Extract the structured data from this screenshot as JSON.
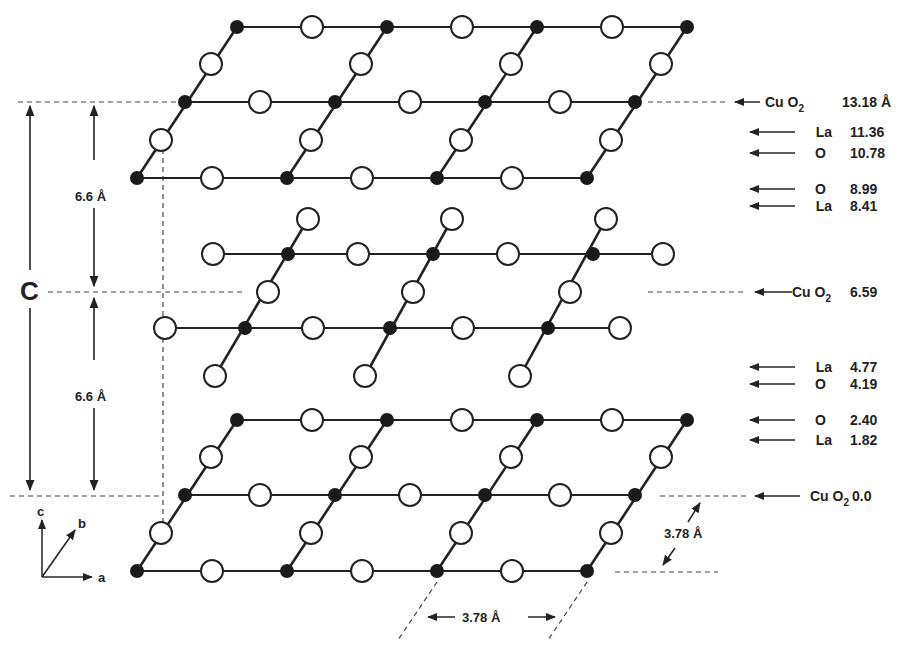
{
  "axes": {
    "a": "a",
    "b": "b",
    "c": "c"
  },
  "cell_axis_label": "C",
  "spacing_upper": "6.6 Å",
  "spacing_lower": "6.6 Å",
  "lattice_a": "3.78 Å",
  "lattice_b": "3.78 Å",
  "legend": {
    "filled_circle": "Cu",
    "open_circle": "O"
  },
  "layers": [
    {
      "species": "Cu O",
      "sub": "2",
      "height": "13.18 Å"
    },
    {
      "species": "La",
      "height": "11.36"
    },
    {
      "species": "O",
      "height": "10.78"
    },
    {
      "species": "O",
      "height": "8.99"
    },
    {
      "species": "La",
      "height": "8.41"
    },
    {
      "species": "Cu O",
      "sub": "2",
      "height": "6.59"
    },
    {
      "species": "La",
      "height": "4.77"
    },
    {
      "species": "O",
      "height": "4.19"
    },
    {
      "species": "O",
      "height": "2.40"
    },
    {
      "species": "La",
      "height": "1.82"
    },
    {
      "species": "Cu O",
      "sub": "2",
      "height": "0.0"
    }
  ]
}
